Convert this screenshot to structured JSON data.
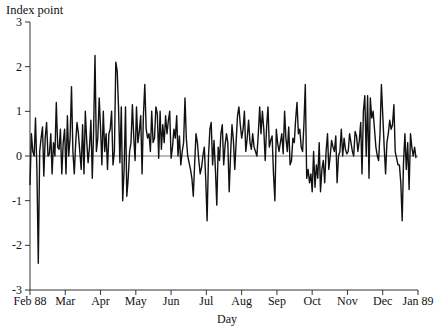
{
  "chart_data": {
    "type": "line",
    "title": "",
    "xlabel": "Day",
    "ylabel": "Index point",
    "ylim": [
      -3,
      3
    ],
    "yticks": [
      -3,
      -2,
      -1,
      0,
      1,
      2,
      3
    ],
    "xticks": [
      "Feb 88",
      "Mar",
      "Apr",
      "May",
      "Jun",
      "Jul",
      "Aug",
      "Sep",
      "Oct",
      "Nov",
      "Dec",
      "Jan 89"
    ],
    "grid": false,
    "reference_line": 0,
    "legend": null,
    "series": [
      {
        "name": "Daily change",
        "color": "#111111",
        "values": [
          -0.65,
          0.5,
          0.1,
          0.0,
          0.85,
          -0.3,
          -2.4,
          0.1,
          0.4,
          0.65,
          -0.45,
          0.4,
          0.75,
          0.0,
          0.05,
          0.5,
          -0.4,
          0.3,
          0.0,
          1.2,
          0.2,
          0.15,
          0.6,
          -0.4,
          0.3,
          0.6,
          -0.4,
          0.9,
          0.0,
          0.4,
          1.55,
          0.1,
          -0.4,
          0.3,
          0.75,
          0.5,
          0.1,
          -0.3,
          0.7,
          -0.4,
          1.0,
          0.35,
          -0.15,
          0.2,
          0.8,
          -0.5,
          0.55,
          2.25,
          0.1,
          0.4,
          1.3,
          0.6,
          -0.2,
          1.0,
          0.1,
          0.5,
          -0.3,
          0.5,
          0.6,
          1.0,
          -0.2,
          0.1,
          2.1,
          1.9,
          1.1,
          -0.15,
          1.1,
          -1.0,
          -0.3,
          1.1,
          -0.9,
          -0.5,
          0.1,
          0.3,
          1.15,
          0.4,
          -0.1,
          1.1,
          0.3,
          0.55,
          0.9,
          -0.4,
          0.9,
          1.6,
          0.6,
          0.4,
          0.5,
          0.1,
          1.0,
          0.3,
          0.4,
          1.1,
          0.95,
          -0.05,
          1.0,
          0.15,
          0.7,
          0.3,
          0.9,
          0.5,
          0.8,
          1.0,
          -0.05,
          0.2,
          0.6,
          0.4,
          0.9,
          0.0,
          0.45,
          -0.2,
          0.1,
          0.3,
          1.3,
          0.4,
          0.0,
          -0.15,
          -0.3,
          -0.5,
          -0.9,
          -0.2,
          0.5,
          0.3,
          -0.1,
          -0.4,
          -0.25,
          0.0,
          0.2,
          -0.5,
          -1.45,
          0.0,
          0.6,
          0.75,
          -0.2,
          0.35,
          -0.3,
          -1.1,
          0.2,
          -0.1,
          0.5,
          0.7,
          -0.2,
          0.25,
          0.5,
          0.3,
          -0.8,
          0.05,
          0.7,
          0.35,
          -0.3,
          0.3,
          0.9,
          1.1,
          0.7,
          0.4,
          0.6,
          1.0,
          0.1,
          0.4,
          0.8,
          0.3,
          0.15,
          0.5,
          0.2,
          0.1,
          0.0,
          0.5,
          1.1,
          0.5,
          1.0,
          0.6,
          -0.1,
          0.65,
          1.1,
          0.2,
          0.35,
          0.45,
          -0.4,
          -1.0,
          0.6,
          0.3,
          0.1,
          0.3,
          0.5,
          0.05,
          1.0,
          0.4,
          0.1,
          0.65,
          -0.2,
          -0.1,
          0.4,
          0.3,
          0.8,
          1.2,
          0.5,
          0.6,
          0.2,
          0.1,
          0.7,
          1.6,
          -0.5,
          -0.3,
          -0.6,
          -0.4,
          -0.8,
          0.1,
          -0.7,
          -0.2,
          -0.5,
          0.3,
          -0.8,
          -0.3,
          -0.1,
          -0.6,
          0.1,
          0.5,
          -0.3,
          0.0,
          0.35,
          0.2,
          0.1,
          0.45,
          -0.6,
          0.0,
          0.1,
          0.6,
          0.0,
          0.4,
          0.15,
          0.05,
          0.1,
          0.5,
          0.3,
          0.1,
          0.0,
          0.55,
          0.45,
          0.1,
          0.35,
          0.75,
          -0.4,
          1.0,
          1.35,
          0.0,
          1.35,
          -0.5,
          1.3,
          0.85,
          1.0,
          0.6,
          0.2,
          0.0,
          -0.1,
          0.5,
          1.6,
          0.9,
          0.2,
          -0.4,
          0.3,
          0.5,
          0.8,
          0.6,
          0.7,
          1.15,
          0.1,
          -0.05,
          -0.2,
          -0.2,
          -0.6,
          -1.45,
          -0.15,
          0.5,
          -0.3,
          0.3,
          -0.75,
          0.5,
          0.2,
          0.0,
          0.2,
          -0.05
        ]
      }
    ]
  },
  "axes": {
    "y_title": "Index point",
    "x_title": "Day",
    "y_tick_labels": [
      "3",
      "2",
      "1",
      "0",
      "-1",
      "-2",
      "-3"
    ],
    "x_tick_labels": [
      "Feb 88",
      "Mar",
      "Apr",
      "May",
      "Jun",
      "Jul",
      "Aug",
      "Sep",
      "Oct",
      "Nov",
      "Dec",
      "Jan 89"
    ]
  }
}
